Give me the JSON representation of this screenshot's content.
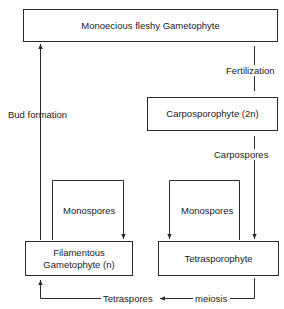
{
  "nodes": {
    "monoecious": "Monoecious fleshy Gametophyte",
    "carposporophyte": "Carposporophyte (2n)",
    "filamentous_line1": "Filamentous",
    "filamentous_line2": "Gametophyte (n)",
    "tetrasporophyte": "Tetrasporophyte"
  },
  "edges": {
    "fertilization": "Fertilization",
    "carpospores": "Carpospores",
    "bud_formation": "Bud formation",
    "monospores_left": "Monospores",
    "monospores_right": "Monospores",
    "tetraspores": "Tetraspores",
    "meiosis": "meiosis"
  },
  "colors": {
    "line": "#2a2a2a",
    "background": "#ffffff"
  }
}
